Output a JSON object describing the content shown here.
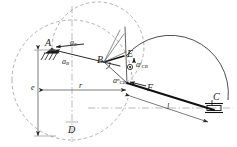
{
  "diagram": {
    "type": "kinematic-vector-diagram",
    "colors": {
      "stroke": "#1a1a1a",
      "construction": "#8a8a8a",
      "background": "#ffffff"
    },
    "points": [
      {
        "id": "A",
        "label": "A",
        "x": 52,
        "y": 48,
        "note": "fixed pivot, ground hatching"
      },
      {
        "id": "B",
        "label": "B",
        "x": 104,
        "y": 62,
        "note": "crank pin"
      },
      {
        "id": "C",
        "label": "C",
        "x": 214,
        "y": 108,
        "note": "slider on horizontal axis"
      },
      {
        "id": "D",
        "label": "D",
        "x": 72,
        "y": 128,
        "note": "base / datum point"
      },
      {
        "id": "E",
        "label": "E",
        "x": 125,
        "y": 57,
        "note": "arc centre of large circle"
      },
      {
        "id": "F",
        "label": "F",
        "x": 130,
        "y": 84,
        "note": "foot of normal-component vector"
      }
    ],
    "vectors": [
      {
        "id": "a_E",
        "label_html": "a<sub>E</sub>",
        "name": "acceleration-aE"
      },
      {
        "id": "a_B",
        "label_html": "a<sub>B</sub>",
        "name": "acceleration-aB"
      },
      {
        "id": "a_CB_t",
        "label_html": "a<sup>t</sup><sub>CB</sub>",
        "name": "acceleration-aCB-tangential"
      },
      {
        "id": "a_CB_n",
        "label_html": "a<sup>n</sup><sub>CB</sub>",
        "name": "acceleration-aCB-normal"
      }
    ],
    "dimensions": [
      {
        "id": "e",
        "label": "e",
        "orientation": "vertical",
        "from": "A",
        "to": "D"
      },
      {
        "id": "r",
        "label": "r",
        "orientation": "horizontal",
        "from": "A",
        "to": "F"
      },
      {
        "id": "l",
        "label": "l",
        "orientation": "oblique",
        "from": "F",
        "to": "C"
      }
    ],
    "labels": {
      "A": "A",
      "B": "B",
      "C": "C",
      "D": "D",
      "E": "E",
      "F": "F",
      "e": "e",
      "r": "r",
      "l": "l"
    }
  }
}
